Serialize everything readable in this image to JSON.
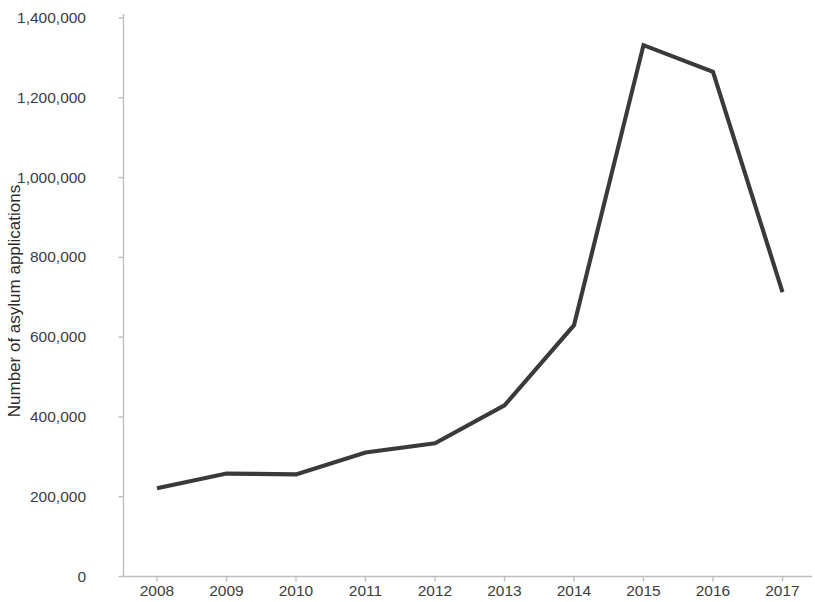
{
  "chart_data": {
    "type": "line",
    "title": "",
    "subtitle": "",
    "xlabel": "",
    "ylabel": "Number of asylum applications",
    "categories": [
      "2008",
      "2009",
      "2010",
      "2011",
      "2012",
      "2013",
      "2014",
      "2015",
      "2016",
      "2017"
    ],
    "x": [
      2008,
      2009,
      2010,
      2011,
      2012,
      2013,
      2014,
      2015,
      2016,
      2017
    ],
    "values": [
      221000,
      258000,
      256000,
      311000,
      334000,
      429000,
      630000,
      1332000,
      1265000,
      713000
    ],
    "series": [
      {
        "name": "Number of asylum applications",
        "values": [
          221000,
          258000,
          256000,
          311000,
          334000,
          429000,
          630000,
          1332000,
          1265000,
          713000
        ],
        "color": "#3a3a3a"
      }
    ],
    "ylim": [
      0,
      1400000
    ],
    "y_tick_values": [
      0,
      200000,
      400000,
      600000,
      800000,
      1000000,
      1200000,
      1400000
    ],
    "y_tick_labels": [
      "0",
      "200,000",
      "400,000",
      "600,000",
      "800,000",
      "1,000,000",
      "1,200,000",
      "1,400,000"
    ],
    "x_tick_labels": [
      "2008",
      "2009",
      "2010",
      "2011",
      "2012",
      "2013",
      "2014",
      "2015",
      "2016",
      "2017"
    ],
    "grid": false,
    "legend": null,
    "legend_position": "none",
    "annotations": [],
    "line_color": "#3a3a3a",
    "axis_color": "#bfbfbf",
    "background_color": "#ffffff"
  },
  "axes": {
    "y_title": "Number of asylum applications"
  }
}
